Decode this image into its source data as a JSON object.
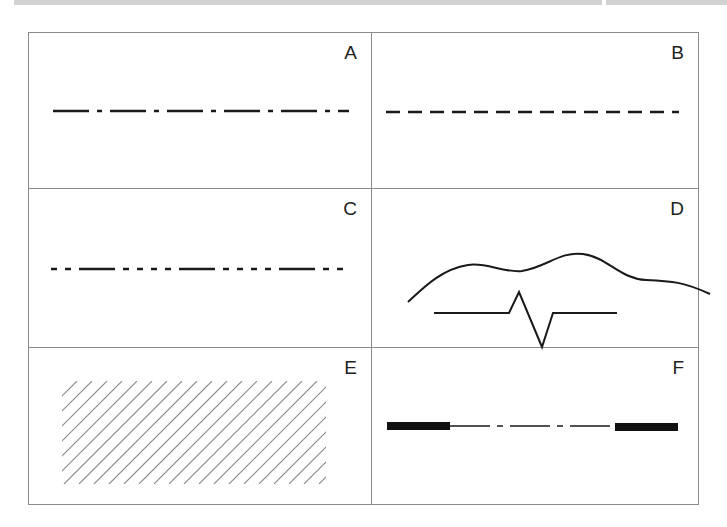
{
  "top_strip": {
    "segments": [
      {
        "x": 14,
        "width": 588
      },
      {
        "x": 606,
        "width": 121
      }
    ],
    "color": "#d2d2d2"
  },
  "panels": [
    {
      "id": "A",
      "label": "A",
      "line_type": "long-dash-short-dash (chain)"
    },
    {
      "id": "B",
      "label": "B",
      "line_type": "dashed"
    },
    {
      "id": "C",
      "label": "C",
      "line_type": "long-dash-double-short-dash (phantom)"
    },
    {
      "id": "D",
      "label": "D",
      "line_type": "freehand break line and zigzag break line"
    },
    {
      "id": "E",
      "label": "E",
      "line_type": "section hatching"
    },
    {
      "id": "F",
      "label": "F",
      "line_type": "cutting plane line (thick ends)"
    }
  ],
  "colors": {
    "stroke": "#1a1a1a",
    "hatch": "#8a8a8a",
    "border": "#8c8c8c"
  }
}
